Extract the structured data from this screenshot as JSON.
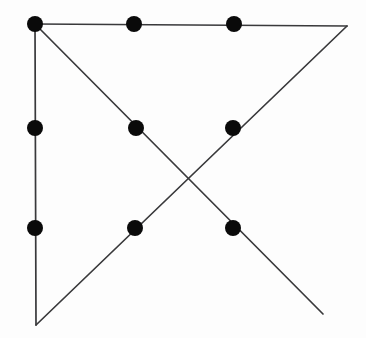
{
  "figure": {
    "type": "geometric-line-diagram",
    "width": 366,
    "height": 338,
    "background_color": "#fdfdfd",
    "line_color": "#39393b",
    "line_width": 1.7,
    "dot_color": "#0a0a0a",
    "dot_radius": 8
  },
  "chart_data": {
    "type": "scatter",
    "xlabel": "",
    "ylabel": "",
    "xlim": [
      0,
      366
    ],
    "ylim": [
      338,
      0
    ],
    "grid": false,
    "legend": null,
    "points": [
      {
        "id": "p1",
        "label": "top-left",
        "x": 35,
        "y": 24,
        "row": 0,
        "col": 0
      },
      {
        "id": "p2",
        "label": "top-center",
        "x": 134,
        "y": 24,
        "row": 0,
        "col": 1
      },
      {
        "id": "p3",
        "label": "top-right",
        "x": 234,
        "y": 24,
        "row": 0,
        "col": 2
      },
      {
        "id": "p4",
        "label": "middle-left",
        "x": 35,
        "y": 128,
        "row": 1,
        "col": 0
      },
      {
        "id": "p5",
        "label": "middle-center",
        "x": 136,
        "y": 128,
        "row": 1,
        "col": 1
      },
      {
        "id": "p6",
        "label": "middle-right",
        "x": 233,
        "y": 128,
        "row": 1,
        "col": 2
      },
      {
        "id": "p7",
        "label": "bottom-left",
        "x": 35,
        "y": 228,
        "row": 2,
        "col": 0
      },
      {
        "id": "p8",
        "label": "bottom-center",
        "x": 135,
        "y": 228,
        "row": 2,
        "col": 1
      },
      {
        "id": "p9",
        "label": "bottom-right",
        "x": 233,
        "y": 228,
        "row": 2,
        "col": 2
      }
    ],
    "segments": [
      {
        "id": "s1",
        "label": "left-vertical",
        "x1": 35,
        "y1": 24,
        "x2": 36,
        "y2": 325
      },
      {
        "id": "s2",
        "label": "top-horizontal",
        "x1": 35,
        "y1": 24,
        "x2": 347,
        "y2": 26
      },
      {
        "id": "s3",
        "label": "right-diagonal-up",
        "x1": 36,
        "y1": 325,
        "x2": 347,
        "y2": 26
      },
      {
        "id": "s4",
        "label": "main-diagonal-down",
        "x1": 35,
        "y1": 24,
        "x2": 323,
        "y2": 314
      }
    ],
    "intersections": [
      {
        "id": "x1",
        "label": "diagonal-crossing",
        "x": 185,
        "y": 183
      }
    ],
    "vertices": [
      {
        "id": "v1",
        "label": "apex-top-left",
        "x": 35,
        "y": 24
      },
      {
        "id": "v2",
        "label": "apex-top-right",
        "x": 347,
        "y": 26
      },
      {
        "id": "v3",
        "label": "apex-bottom-left",
        "x": 36,
        "y": 325
      },
      {
        "id": "v4",
        "label": "endpoint-bottom-right",
        "x": 323,
        "y": 314
      }
    ]
  }
}
